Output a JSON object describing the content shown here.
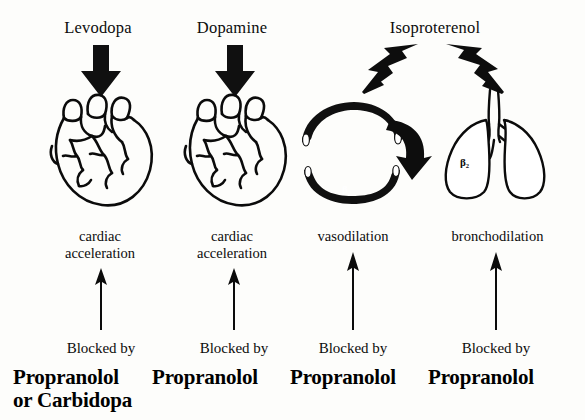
{
  "figure": {
    "background_color": "#fdfdfb",
    "ink_color": "#0c0c0c"
  },
  "columns": [
    {
      "id": "levodopa",
      "drug": "Levodopa",
      "organ_icon": "heart-icon",
      "organ_label": "heart",
      "receptor": "",
      "effect": "cardiac\nacceleration",
      "effect_line1": "cardiac",
      "effect_line2": "acceleration",
      "blocked_by_label": "Blocked by",
      "blocker_line1": "Propranolol",
      "blocker_line2": "or Carbidopa",
      "down_arrow_icon": "thick-down-arrow-icon",
      "up_arrow_icon": "thin-up-arrow-icon"
    },
    {
      "id": "dopamine",
      "drug": "Dopamine",
      "organ_icon": "heart-icon",
      "organ_label": "heart",
      "receptor": "",
      "effect_line1": "cardiac",
      "effect_line2": "acceleration",
      "blocked_by_label": "Blocked by",
      "blocker_line1": "Propranolol",
      "blocker_line2": "",
      "down_arrow_icon": "thick-down-arrow-icon",
      "up_arrow_icon": "thin-up-arrow-icon"
    },
    {
      "id": "isoproterenol-vessel",
      "drug": "Isoproterenol",
      "organ_icon": "blood-vessel-icon",
      "organ_label": "blood vessel",
      "receptor": "β₂",
      "effect_line1": "vasodilation",
      "effect_line2": "",
      "blocked_by_label": "Blocked by",
      "blocker_line1": "Propranolol",
      "blocker_line2": "",
      "down_arrow_icon": "thick-diagonal-arrow-left-icon",
      "up_arrow_icon": "thin-up-arrow-icon",
      "dilation_arrow_icon": "curved-dilation-arrow-icon"
    },
    {
      "id": "isoproterenol-lung",
      "drug": "",
      "organ_icon": "lungs-icon",
      "organ_label": "lungs",
      "receptor": "β₂",
      "effect_line1": "bronchodilation",
      "effect_line2": "",
      "blocked_by_label": "Blocked by",
      "blocker_line1": "Propranolol",
      "blocker_line2": "",
      "down_arrow_icon": "thick-diagonal-arrow-right-icon",
      "up_arrow_icon": "thin-up-arrow-icon"
    }
  ],
  "shared": {
    "isoproterenol_label": "Isoproterenol"
  }
}
